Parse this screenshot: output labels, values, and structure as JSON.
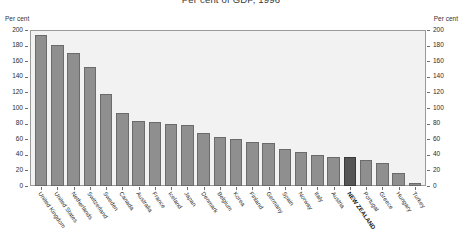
{
  "chart_data": {
    "type": "bar",
    "title": "Per cent of GDP, 1996",
    "xlabel": "",
    "ylabel": "Per cent",
    "ylabel_right": "Per cent",
    "ylim": [
      0,
      200
    ],
    "ytick_step": 20,
    "yticks": [
      200,
      180,
      160,
      140,
      120,
      100,
      80,
      60,
      40,
      20,
      0
    ],
    "grid": false,
    "legend": "none",
    "highlight_category": "NEW ZEALAND",
    "colors": {
      "bar": "#8f8f8f",
      "bar_border": "#6b6b6b",
      "highlight_bar": "#555555",
      "highlight_bar_border": "#3a3a3a",
      "plot_background": "#f2f2f2",
      "axis": "#9a9a9a",
      "text": "#2e2e2e"
    },
    "categories": [
      "United Kingdom",
      "United States",
      "Netherlands",
      "Switzerland",
      "Sweden",
      "Canada",
      "Australia",
      "France",
      "Iceland",
      "Japan",
      "Denmark",
      "Belgium",
      "Korea",
      "Finland",
      "Germany",
      "Spain",
      "Norway",
      "Italy",
      "Austria",
      "NEW ZEALAND",
      "Portugal",
      "Greece",
      "Hungary",
      "Turkey"
    ],
    "values": [
      194,
      181,
      170,
      152,
      118,
      94,
      83,
      82,
      80,
      78,
      68,
      63,
      60,
      56,
      55,
      48,
      43,
      40,
      37,
      37,
      33,
      30,
      17,
      4
    ]
  }
}
